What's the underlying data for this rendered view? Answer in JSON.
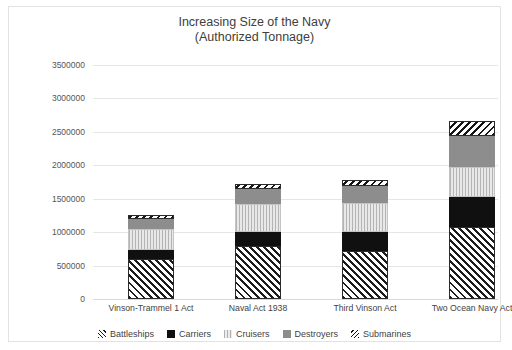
{
  "chart_data": {
    "type": "bar",
    "subtype": "stacked-column",
    "title": "Increasing Size of the Navy",
    "subtitle": "(Authorized Tonnage)",
    "xlabel": "",
    "ylabel": "",
    "grid": true,
    "legend_position": "bottom",
    "ylim": [
      0,
      3500000
    ],
    "ytick_step": 500000,
    "ytick_labels": [
      "0",
      "500000",
      "1000000",
      "1500000",
      "2000000",
      "2500000",
      "3000000",
      "3500000"
    ],
    "categories": [
      "Vinson-Trammel 1 Act",
      "Naval Act 1938",
      "Third Vinson Act",
      "Two Ocean Navy Act"
    ],
    "series": [
      {
        "name": "Battleships",
        "values": [
          600000,
          800000,
          720000,
          1080000
        ]
      },
      {
        "name": "Carriers",
        "values": [
          135000,
          205000,
          285000,
          450000
        ]
      },
      {
        "name": "Cruisers",
        "values": [
          310000,
          410000,
          435000,
          440000
        ]
      },
      {
        "name": "Destroyers",
        "values": [
          150000,
          235000,
          250000,
          465000
        ]
      },
      {
        "name": "Submarines",
        "values": [
          60000,
          75000,
          90000,
          230000
        ]
      }
    ],
    "totals": [
      1255000,
      1725000,
      1780000,
      2665000
    ]
  },
  "legend": {
    "items": [
      {
        "label": "Battleships",
        "key": "battleships-pattern-swatch"
      },
      {
        "label": "Carriers",
        "key": "carriers-black-swatch"
      },
      {
        "label": "Cruisers",
        "key": "cruisers-light-swatch"
      },
      {
        "label": "Destroyers",
        "key": "destroyers-gray-swatch"
      },
      {
        "label": "Submarines",
        "key": "submarines-pattern-swatch"
      }
    ]
  },
  "colors": {
    "carriers": "#101010",
    "cruisers": "#dedede",
    "destroyers": "#8d8d8d",
    "gridline": "#e6e6e6",
    "text": "#3f3f3f",
    "background": "#ffffff"
  }
}
